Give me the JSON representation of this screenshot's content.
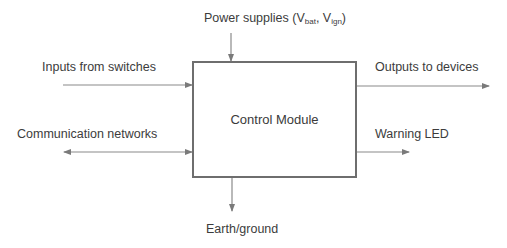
{
  "diagram": {
    "central_block": {
      "label": "Control Module"
    },
    "power": {
      "label_prefix": "Power supplies (V",
      "sub1": "bat",
      "mid": ", V",
      "sub2": "ign",
      "suffix": ")"
    },
    "inputs": {
      "label": "Inputs from switches"
    },
    "communication": {
      "label": "Communication networks"
    },
    "outputs": {
      "label": "Outputs to devices"
    },
    "warning": {
      "label": "Warning LED"
    },
    "earth": {
      "label": "Earth/ground"
    },
    "colors": {
      "line": "#7a7a7a",
      "box_border": "#6e6e6e",
      "text": "#3c3c3c"
    }
  }
}
